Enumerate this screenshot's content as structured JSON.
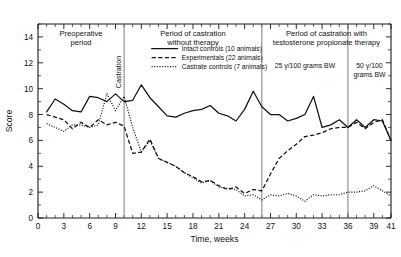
{
  "chart_data": {
    "type": "line",
    "title": "",
    "xlabel": "Time, weeks",
    "ylabel": "Score",
    "xlim": [
      0,
      41
    ],
    "ylim": [
      0,
      15
    ],
    "grid": false,
    "legend_position": "top-center",
    "x_ticks": [
      0,
      3,
      6,
      9,
      12,
      15,
      18,
      21,
      24,
      27,
      30,
      33,
      36,
      39,
      41
    ],
    "y_ticks": [
      0,
      2,
      4,
      6,
      8,
      10,
      12,
      14
    ],
    "x_minor_step": 1,
    "y_minor_step": 1,
    "annotations": [
      {
        "name": "preoperative-period",
        "text_line1": "Preoperative",
        "text_line2": "period",
        "x": 5.0
      },
      {
        "name": "period-castration-no-therapy",
        "text_line1": "Period of castration",
        "text_line2": "without therapy",
        "x": 18.0
      },
      {
        "name": "period-castration-with-therapy",
        "text_line1": "Period of castration with",
        "text_line2": "testosterone propionate therapy",
        "x": 33.5
      },
      {
        "name": "dose-25",
        "text": "25 γ/100 grams BW",
        "x": 31.0
      },
      {
        "name": "dose-50-line1",
        "text": "50 γ/100",
        "x": 38.5
      },
      {
        "name": "dose-50-line2",
        "text": "grams BW",
        "x": 38.5
      },
      {
        "name": "castration-marker",
        "text": "Castration",
        "x": 10.0
      }
    ],
    "dividers": [
      10.0,
      26.0,
      36.0
    ],
    "series": [
      {
        "name": "Intact controls (10 animals)",
        "style": "solid",
        "x": [
          1,
          2,
          3,
          4,
          5,
          6,
          7,
          8,
          9,
          10,
          11,
          12,
          13,
          14,
          15,
          16,
          17,
          18,
          19,
          20,
          21,
          22,
          23,
          24,
          25,
          26,
          27,
          28,
          29,
          30,
          31,
          32,
          33,
          34,
          35,
          36,
          37,
          38,
          39,
          40,
          41
        ],
        "values": [
          8.2,
          9.2,
          8.8,
          8.3,
          8.2,
          9.4,
          9.3,
          9.0,
          9.6,
          9.0,
          9.1,
          10.3,
          9.3,
          8.6,
          7.9,
          7.8,
          8.1,
          8.3,
          8.4,
          8.7,
          8.1,
          7.9,
          7.5,
          8.4,
          9.8,
          8.6,
          8.0,
          8.0,
          7.5,
          7.7,
          8.0,
          9.4,
          7.0,
          7.2,
          7.6,
          7.0,
          7.6,
          7.0,
          7.6,
          7.5,
          6.0
        ]
      },
      {
        "name": "Experimentals (22 animals)",
        "style": "dashed",
        "x": [
          1,
          2,
          3,
          4,
          5,
          6,
          7,
          8,
          9,
          10,
          11,
          12,
          13,
          14,
          15,
          16,
          17,
          18,
          19,
          20,
          21,
          22,
          23,
          24,
          25,
          26,
          27,
          28,
          29,
          30,
          31,
          32,
          33,
          34,
          35,
          36,
          37,
          38,
          39,
          40,
          41
        ],
        "values": [
          8.0,
          7.8,
          7.6,
          6.9,
          7.4,
          7.0,
          7.6,
          7.2,
          7.4,
          7.1,
          5.0,
          5.1,
          6.1,
          4.6,
          4.3,
          4.0,
          3.5,
          3.2,
          2.8,
          2.9,
          2.5,
          2.2,
          2.4,
          1.9,
          2.2,
          2.1,
          3.4,
          4.6,
          5.2,
          5.7,
          6.3,
          6.4,
          6.6,
          6.9,
          7.0,
          7.0,
          7.4,
          6.9,
          7.4,
          7.6,
          6.0
        ]
      },
      {
        "name": "Castrate controls (7 animals)",
        "style": "dotted",
        "x": [
          1,
          2,
          3,
          4,
          5,
          6,
          7,
          8,
          9,
          10,
          11,
          12,
          13,
          14,
          15,
          16,
          17,
          18,
          19,
          20,
          21,
          22,
          23,
          24,
          25,
          26,
          27,
          28,
          29,
          30,
          31,
          32,
          33,
          34,
          35,
          36,
          37,
          38,
          39,
          40,
          41
        ],
        "values": [
          7.3,
          7.0,
          6.7,
          7.2,
          7.2,
          7.0,
          7.2,
          9.6,
          8.3,
          9.4,
          7.0,
          5.1,
          6.0,
          4.6,
          4.3,
          4.0,
          3.5,
          3.1,
          2.7,
          2.9,
          2.4,
          2.3,
          2.2,
          1.7,
          1.8,
          1.4,
          1.8,
          1.7,
          1.9,
          1.7,
          1.3,
          1.8,
          1.7,
          1.8,
          1.8,
          2.0,
          2.0,
          2.1,
          2.5,
          2.1,
          1.7
        ]
      }
    ]
  },
  "legend": {
    "items": [
      {
        "label": "Intact controls (10 animals)",
        "style": "solid"
      },
      {
        "label": "Experimentals (22 animals)",
        "style": "dashed"
      },
      {
        "label": "Castrate controls (7 animals)",
        "style": "dotted"
      }
    ]
  }
}
